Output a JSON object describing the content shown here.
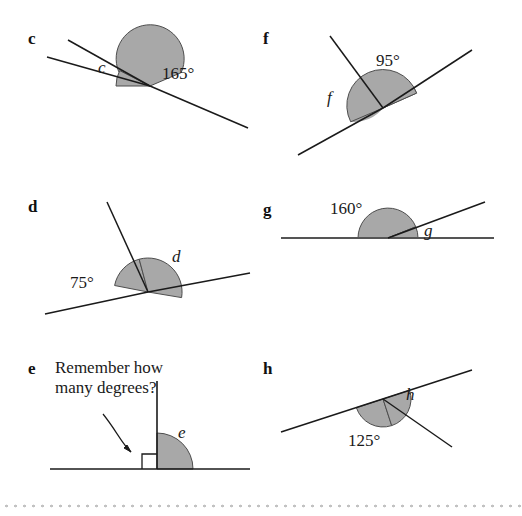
{
  "page": {
    "type": "geometry-worksheet",
    "background": "#ffffff",
    "sector_fill": "#a8a8a8",
    "sector_stroke": "#4d4d4d",
    "line_color": "#1a1a1a",
    "divider_color": "#c2c2c2"
  },
  "problems": [
    {
      "id": "c",
      "label": "c",
      "known_angle": "165°",
      "unknown_angle": "c",
      "label_pos": {
        "x": 30,
        "y": 32
      },
      "vertex": {
        "x": 150,
        "y": 86
      },
      "rays": [
        {
          "name": "upper-left-ray",
          "x2": 68,
          "y2": 40
        },
        {
          "name": "lower-left-ray",
          "x2": 47,
          "y2": 57
        },
        {
          "name": "right-ray",
          "x2": 248,
          "y2": 128
        }
      ],
      "arcs": [
        {
          "name": "known-sector",
          "radius": 34,
          "start_deg": 203,
          "end_deg": 27,
          "value": "165°",
          "text_pos": {
            "x": 162,
            "y": 73
          }
        },
        {
          "name": "unknown-sector",
          "radius": 34,
          "start_deg": 180,
          "end_deg": 207,
          "value": "c",
          "text_pos": {
            "x": 100,
            "y": 68
          }
        }
      ]
    },
    {
      "id": "f",
      "label": "f",
      "known_angle": "95°",
      "unknown_angle": "f",
      "label_pos": {
        "x": 265,
        "y": 32
      },
      "vertex": {
        "x": 383,
        "y": 108
      },
      "rays": [
        {
          "name": "upper-ray",
          "x2": 330,
          "y2": 36
        },
        {
          "name": "down-left-ray",
          "x2": 298,
          "y2": 155
        },
        {
          "name": "up-right-ray",
          "x2": 472,
          "y2": 50
        }
      ],
      "arcs": [
        {
          "name": "known-sector",
          "radius": 36,
          "start_deg": 234,
          "end_deg": 339,
          "value": "95°",
          "text_pos": {
            "x": 378,
            "y": 60
          }
        },
        {
          "name": "unknown-sector",
          "radius": 36,
          "start_deg": 126,
          "end_deg": 234,
          "value": "f",
          "text_pos": {
            "x": 330,
            "y": 98
          }
        }
      ]
    },
    {
      "id": "d",
      "label": "d",
      "known_angle": "75°",
      "unknown_angle": "d",
      "label_pos": {
        "x": 30,
        "y": 200
      },
      "vertex": {
        "x": 148,
        "y": 292
      },
      "rays": [
        {
          "name": "upper-ray",
          "x2": 107,
          "y2": 202
        },
        {
          "name": "left-ray",
          "x2": 45,
          "y2": 314
        },
        {
          "name": "right-ray",
          "x2": 250,
          "y2": 273
        }
      ],
      "arcs": [
        {
          "name": "known-sector",
          "radius": 34,
          "start_deg": 191,
          "end_deg": 255,
          "value": "75°",
          "text_pos": {
            "x": 78,
            "y": 284
          }
        },
        {
          "name": "unknown-sector",
          "radius": 34,
          "start_deg": 255,
          "end_deg": 371,
          "value": "d",
          "text_pos": {
            "x": 176,
            "y": 258
          }
        }
      ]
    },
    {
      "id": "g",
      "label": "g",
      "known_angle": "160°",
      "unknown_angle": "g",
      "label_pos": {
        "x": 265,
        "y": 203
      },
      "vertex": {
        "x": 388,
        "y": 238
      },
      "rays": [
        {
          "name": "baseline-left",
          "x2": 281,
          "y2": 238
        },
        {
          "name": "baseline-right",
          "x2": 494,
          "y2": 238
        },
        {
          "name": "up-right-ray",
          "x2": 485,
          "y2": 202
        }
      ],
      "arcs": [
        {
          "name": "known-sector",
          "radius": 30,
          "start_deg": 180,
          "end_deg": 338,
          "value": "160°",
          "text_pos": {
            "x": 352,
            "y": 212
          }
        },
        {
          "name": "unknown-sector",
          "radius": 30,
          "start_deg": 338,
          "end_deg": 360,
          "value": "g",
          "text_pos": {
            "x": 428,
            "y": 234
          }
        }
      ]
    },
    {
      "id": "e",
      "label": "e",
      "known_angle": "",
      "unknown_angle": "e",
      "hint": "Remember how many degrees?",
      "label_pos": {
        "x": 30,
        "y": 362
      },
      "vertex": {
        "x": 157,
        "y": 469
      },
      "rays": [
        {
          "name": "vertical-ray",
          "x2": 157,
          "y2": 381
        },
        {
          "name": "baseline-left",
          "x2": 50,
          "y2": 469
        },
        {
          "name": "baseline-right",
          "x2": 250,
          "y2": 469
        }
      ],
      "right_angle_marker": {
        "name": "right-angle-square",
        "size": 15
      },
      "arcs": [
        {
          "name": "unknown-sector",
          "radius": 36,
          "start_deg": 270,
          "end_deg": 360,
          "value": "e",
          "text_pos": {
            "x": 183,
            "y": 434
          }
        }
      ]
    },
    {
      "id": "h",
      "label": "h",
      "known_angle": "125°",
      "unknown_angle": "h",
      "label_pos": {
        "x": 265,
        "y": 362
      },
      "vertex": {
        "x": 383,
        "y": 399
      },
      "rays": [
        {
          "name": "line-up-right",
          "x2": 472,
          "y2": 370
        },
        {
          "name": "line-down-left",
          "x2": 281,
          "y2": 432
        },
        {
          "name": "down-right-ray",
          "x2": 452,
          "y2": 447
        }
      ],
      "arcs": [
        {
          "name": "known-sector",
          "radius": 28,
          "start_deg": 162,
          "end_deg": 288,
          "value": "125°",
          "text_pos": {
            "x": 355,
            "y": 440
          }
        },
        {
          "name": "unknown-sector",
          "radius": 28,
          "start_deg": 288,
          "end_deg": 342,
          "value": "h",
          "text_pos": {
            "x": 410,
            "y": 396
          }
        }
      ]
    }
  ]
}
